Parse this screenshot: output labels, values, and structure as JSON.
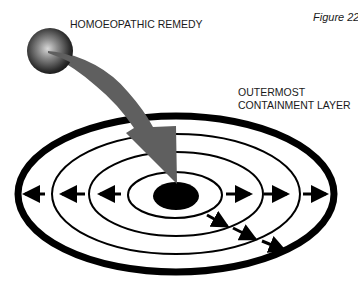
{
  "figure": {
    "caption": "Figure 22",
    "remedy_label": "HOMOEOPATHIC REMEDY",
    "layer_label_line1": "OUTERMOST",
    "layer_label_line2": "CONTAINMENT LAYER"
  },
  "diagram": {
    "type": "concentric-target",
    "center": [
      176,
      195
    ],
    "rings": [
      {
        "name": "outermost-containment-layer",
        "rx": 158,
        "ry": 78,
        "stroke": 7
      },
      {
        "name": "ring-3",
        "rx": 124,
        "ry": 60,
        "stroke": 2
      },
      {
        "name": "ring-2",
        "rx": 87,
        "ry": 42,
        "stroke": 2
      },
      {
        "name": "ring-1",
        "rx": 47,
        "ry": 23,
        "stroke": 2
      }
    ],
    "core": {
      "rx": 23,
      "ry": 14,
      "color": "#000000"
    },
    "remedy_sphere": {
      "cx": 50,
      "cy": 51,
      "r": 23
    },
    "remedy_arrow_color": "#5f5f5f",
    "outward_arrows": {
      "left": 3,
      "right": 3,
      "diagonal": 3
    }
  }
}
